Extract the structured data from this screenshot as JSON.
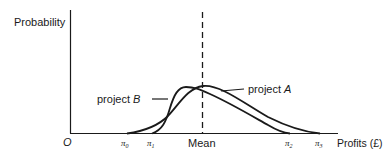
{
  "diagram": {
    "y_axis_label": "Probability",
    "x_axis_label": "Profits (£)",
    "origin_label": "O",
    "mean_label": "Mean",
    "ticks": {
      "pi0": "π",
      "pi0_sub": "0",
      "pi1": "π",
      "pi1_sub": "1",
      "pi2": "π",
      "pi2_sub": "2",
      "pi3": "π",
      "pi3_sub": "3"
    },
    "curves": {
      "project_a": {
        "label_prefix": "project ",
        "label_letter": "A",
        "range": "π0 to π3"
      },
      "project_b": {
        "label_prefix": "project ",
        "label_letter": "B",
        "range": "π1 to π2"
      }
    },
    "colors": {
      "ink": "#1a1a1a",
      "background": "#ffffff"
    }
  }
}
